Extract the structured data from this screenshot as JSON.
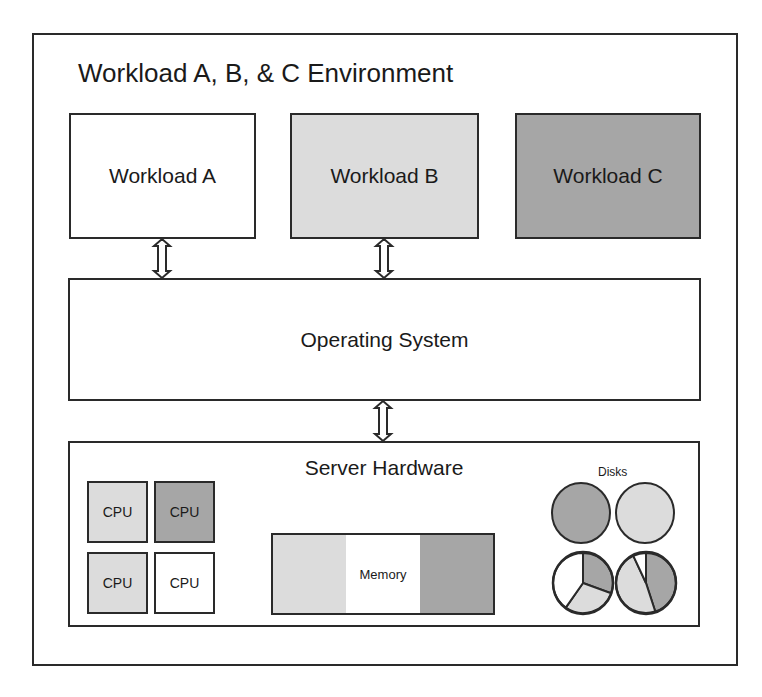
{
  "diagram": {
    "title": "Workload A, B, & C Environment",
    "workloads": [
      {
        "label": "Workload A",
        "fill": "#ffffff",
        "left": 69,
        "width": 187
      },
      {
        "label": "Workload B",
        "fill": "#dcdcdc",
        "left": 290,
        "width": 189
      },
      {
        "label": "Workload C",
        "fill": "#a6a6a6",
        "left": 515,
        "width": 186
      }
    ],
    "operating_system": {
      "label": "Operating System"
    },
    "server_hardware": {
      "label": "Server Hardware",
      "cpus": [
        {
          "label": "CPU",
          "fill": "#dcdcdc",
          "left": 87,
          "top": 481
        },
        {
          "label": "CPU",
          "fill": "#a6a6a6",
          "left": 154,
          "top": 481
        },
        {
          "label": "CPU",
          "fill": "#dcdcdc",
          "left": 87,
          "top": 552
        },
        {
          "label": "CPU",
          "fill": "#ffffff",
          "left": 154,
          "top": 552
        }
      ],
      "memory": {
        "label": "Memory",
        "segments": [
          "#dcdcdc",
          "#ffffff",
          "#a6a6a6"
        ]
      },
      "disks": {
        "label": "Disks",
        "items": [
          {
            "cx": 581,
            "cy": 513,
            "r": 29,
            "slices": [
              {
                "from": 0,
                "to": 360,
                "fill": "#a6a6a6"
              }
            ]
          },
          {
            "cx": 645,
            "cy": 513,
            "r": 29,
            "slices": [
              {
                "from": 0,
                "to": 360,
                "fill": "#dcdcdc"
              }
            ]
          },
          {
            "cx": 583,
            "cy": 583,
            "r": 30,
            "slices": [
              {
                "from": 0,
                "to": 110,
                "fill": "#a6a6a6"
              },
              {
                "from": 110,
                "to": 215,
                "fill": "#dcdcdc"
              },
              {
                "from": 215,
                "to": 360,
                "fill": "#ffffff"
              }
            ]
          },
          {
            "cx": 646,
            "cy": 583,
            "r": 30,
            "slices": [
              {
                "from": 0,
                "to": 162,
                "fill": "#a6a6a6"
              },
              {
                "from": 162,
                "to": 335,
                "fill": "#dcdcdc"
              },
              {
                "from": 335,
                "to": 360,
                "fill": "#ffffff"
              }
            ]
          }
        ]
      }
    },
    "connectors": [
      {
        "name": "workload-a-os-arrow",
        "x": 162,
        "y1": 239,
        "y2": 278
      },
      {
        "name": "workload-b-os-arrow",
        "x": 384,
        "y1": 239,
        "y2": 278
      },
      {
        "name": "os-hardware-arrow",
        "x": 383,
        "y1": 401,
        "y2": 441
      }
    ],
    "colors": {
      "light": "#dcdcdc",
      "dark": "#a6a6a6",
      "white": "#ffffff",
      "stroke": "#2a2a2a"
    }
  }
}
